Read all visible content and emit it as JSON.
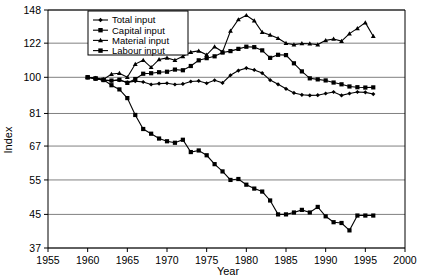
{
  "chart_data": {
    "type": "line",
    "title": "",
    "xlabel": "Year",
    "ylabel": "Index",
    "xlim": [
      1955,
      2000
    ],
    "ylim": [
      37,
      148
    ],
    "yscale": "log",
    "grid": "horizontal",
    "legend_position": "top-left-inside",
    "xticks": [
      1955,
      1960,
      1965,
      1970,
      1975,
      1980,
      1985,
      1990,
      1995,
      2000
    ],
    "yticks": [
      37,
      45,
      55,
      67,
      81,
      100,
      122,
      148
    ],
    "xtick_labels": [
      "1955",
      "1960",
      "1965",
      "1970",
      "1975",
      "1980",
      "1985",
      "1990",
      "1995",
      "2000"
    ],
    "ytick_labels": [
      "37",
      "45",
      "55",
      "67",
      "81",
      "100",
      "122",
      "148"
    ],
    "x": [
      1960,
      1961,
      1962,
      1963,
      1964,
      1965,
      1966,
      1967,
      1968,
      1969,
      1970,
      1971,
      1972,
      1973,
      1974,
      1975,
      1976,
      1977,
      1978,
      1979,
      1980,
      1981,
      1982,
      1983,
      1984,
      1985,
      1986,
      1987,
      1988,
      1989,
      1990,
      1991,
      1992,
      1993,
      1994,
      1995,
      1996
    ],
    "series": [
      {
        "name": "Total input",
        "marker": "diamond",
        "values": [
          100.0,
          99.2,
          98.4,
          98.0,
          98.4,
          97.1,
          97.8,
          97.3,
          95.9,
          96.4,
          96.6,
          95.9,
          96.2,
          97.6,
          97.9,
          96.6,
          98.3,
          96.8,
          101.2,
          104.0,
          105.5,
          104.4,
          102.5,
          98.4,
          96.0,
          93.5,
          91.3,
          90.3,
          90.0,
          90.1,
          91.0,
          91.8,
          90.0,
          91.0,
          91.8,
          91.6,
          90.7
        ]
      },
      {
        "name": "Capital input",
        "marker": "square",
        "values": [
          100.0,
          99.2,
          98.4,
          98.1,
          98.6,
          96.8,
          99.0,
          102.1,
          102.4,
          103.0,
          103.3,
          104.6,
          104.2,
          106.8,
          110.4,
          111.8,
          113.0,
          115.5,
          116.5,
          118.0,
          119.5,
          119.2,
          117.0,
          112.0,
          114.0,
          113.8,
          108.5,
          103.5,
          99.4,
          98.8,
          98.2,
          97.0,
          96.0,
          94.8,
          94.4,
          94.2,
          94.3
        ]
      },
      {
        "name": "Material input",
        "marker": "triangle",
        "values": [
          100.0,
          99.5,
          98.8,
          101.9,
          102.4,
          100.0,
          108.0,
          110.5,
          106.0,
          111.0,
          112.0,
          110.5,
          113.0,
          115.8,
          116.6,
          114.0,
          119.5,
          116.0,
          131.0,
          140.0,
          143.5,
          139.0,
          130.0,
          128.0,
          125.5,
          122.0,
          121.0,
          121.8,
          121.6,
          121.0,
          124.0,
          125.0,
          123.5,
          129.0,
          133.0,
          137.5,
          127.0
        ]
      },
      {
        "name": "Labour input",
        "marker": "square",
        "values": [
          100.0,
          99.4,
          98.6,
          95.5,
          93.2,
          88.6,
          80.3,
          74.0,
          72.0,
          70.0,
          68.9,
          68.3,
          69.5,
          64.7,
          65.3,
          63.5,
          60.3,
          57.8,
          55.0,
          55.3,
          53.5,
          52.3,
          51.4,
          48.8,
          45.0,
          45.0,
          45.5,
          46.2,
          45.5,
          47.0,
          44.5,
          43.0,
          42.8,
          41.0,
          44.7,
          44.7,
          44.7
        ]
      }
    ]
  },
  "legend": {
    "entries": [
      {
        "label": "Total input"
      },
      {
        "label": "Capital input"
      },
      {
        "label": "Material input"
      },
      {
        "label": "Labour input"
      }
    ]
  }
}
